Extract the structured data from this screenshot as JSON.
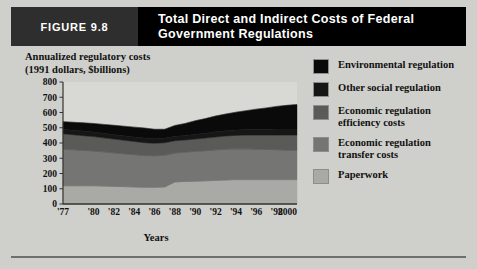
{
  "header": {
    "figure_number": "FIGURE 9.8",
    "title": "Total Direct and Indirect Costs of Federal Government Regulations",
    "bar_color": "#000000",
    "number_box_color": "#2e2e2e",
    "text_color": "#ffffff"
  },
  "page": {
    "background": "#cfcfcb"
  },
  "axes": {
    "y_title": "Annualized regulatory costs\n(1991 dollars, $billions)",
    "x_title": "Years"
  },
  "legend": {
    "items": [
      {
        "label": "Environmental regulation",
        "color": "#0a0a0a"
      },
      {
        "label": "Other social regulation",
        "color": "#161616"
      },
      {
        "label": "Economic regulation\nefficiency costs",
        "color": "#5a5a58"
      },
      {
        "label": "Economic regulation\ntransfer costs",
        "color": "#757573"
      },
      {
        "label": "Paperwork",
        "color": "#a9a9a5"
      }
    ]
  },
  "chart_data": {
    "type": "area",
    "title": "Total Direct and Indirect Costs of Federal Government Regulations",
    "subtitle": "",
    "xlabel": "Years",
    "ylabel": "Annualized regulatory costs (1991 dollars, $billions)",
    "ylim": [
      0,
      800
    ],
    "y_ticks": [
      0,
      100,
      200,
      300,
      400,
      500,
      600,
      700,
      800
    ],
    "x_tick_labels": [
      "'77",
      "'80",
      "'82",
      "'84",
      "'86",
      "'88",
      "'90",
      "'92",
      "'94",
      "'96",
      "'98",
      "2000"
    ],
    "x_tick_years": [
      1977,
      1980,
      1982,
      1984,
      1986,
      1988,
      1990,
      1992,
      1994,
      1996,
      1998,
      2000
    ],
    "xlim": [
      1977,
      2000
    ],
    "grid": false,
    "legend_position": "right",
    "stacked": true,
    "x": [
      1977,
      1978,
      1979,
      1980,
      1981,
      1982,
      1983,
      1984,
      1985,
      1986,
      1987,
      1988,
      1989,
      1990,
      1991,
      1992,
      1993,
      1994,
      1995,
      1996,
      1997,
      1998,
      1999,
      2000
    ],
    "series": [
      {
        "name": "Paperwork",
        "color": "#a9a9a5",
        "values": [
          120,
          120,
          120,
          120,
          118,
          116,
          114,
          112,
          110,
          110,
          112,
          145,
          148,
          150,
          152,
          155,
          158,
          160,
          160,
          160,
          160,
          160,
          160,
          160
        ]
      },
      {
        "name": "Economic regulation transfer costs",
        "color": "#757573",
        "values": [
          240,
          236,
          232,
          228,
          224,
          220,
          216,
          212,
          208,
          206,
          208,
          190,
          192,
          196,
          198,
          200,
          202,
          202,
          202,
          200,
          198,
          196,
          194,
          192
        ]
      },
      {
        "name": "Economic regulation efficiency costs",
        "color": "#5a5a58",
        "values": [
          100,
          98,
          96,
          94,
          92,
          90,
          88,
          86,
          84,
          82,
          82,
          80,
          80,
          80,
          82,
          84,
          86,
          88,
          90,
          92,
          94,
          96,
          98,
          100
        ]
      },
      {
        "name": "Other social regulation",
        "color": "#161616",
        "values": [
          30,
          30,
          30,
          30,
          30,
          30,
          30,
          30,
          30,
          30,
          30,
          30,
          30,
          32,
          32,
          34,
          34,
          36,
          36,
          38,
          38,
          40,
          40,
          40
        ]
      },
      {
        "name": "Environmental regulation",
        "color": "#0a0a0a",
        "values": [
          50,
          52,
          54,
          56,
          58,
          60,
          62,
          64,
          66,
          62,
          58,
          70,
          78,
          88,
          96,
          104,
          110,
          116,
          124,
          132,
          140,
          148,
          155,
          160
        ]
      }
    ],
    "totals": [
      540,
      536,
      532,
      528,
      522,
      516,
      510,
      504,
      498,
      490,
      490,
      515,
      528,
      546,
      560,
      577,
      590,
      602,
      612,
      622,
      630,
      640,
      647,
      652
    ],
    "plot_background": "#d8d8d4",
    "axis_color": "#333333"
  }
}
